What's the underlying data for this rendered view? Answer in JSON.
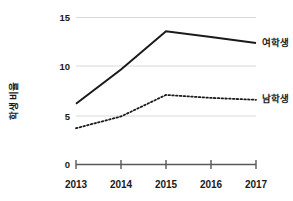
{
  "chart_data": {
    "type": "line",
    "title": "",
    "xlabel": "",
    "ylabel": "학생 비율",
    "categories": [
      "2013",
      "2014",
      "2015",
      "2016",
      "2017"
    ],
    "x": [
      2013,
      2014,
      2015,
      2016,
      2017
    ],
    "series": [
      {
        "name": "여학생",
        "style": "solid",
        "color": "#1a1a1a",
        "values": [
          6.2,
          9.7,
          13.6,
          13.0,
          12.4
        ]
      },
      {
        "name": "남학생",
        "style": "dotted",
        "color": "#1a1a1a",
        "values": [
          3.7,
          4.9,
          7.1,
          6.8,
          6.6
        ]
      }
    ],
    "ylim": [
      0,
      15
    ],
    "yticks": [
      0,
      5,
      10,
      15
    ],
    "ytick_labels": [
      "0",
      "5",
      "10",
      "15"
    ],
    "grid": true,
    "grid_axis": "y",
    "grid_color": "#d9d9d9",
    "legend": "inline-right",
    "legend_entries": [
      "여학생",
      "남학생"
    ],
    "axis_color": "#595959"
  },
  "axis": {
    "y_ticks": [
      {
        "label": "15",
        "value": 15
      },
      {
        "label": "10",
        "value": 10
      },
      {
        "label": "5",
        "value": 5
      },
      {
        "label": "0",
        "value": 0
      }
    ],
    "x_ticks": [
      {
        "label": "2013"
      },
      {
        "label": "2014"
      },
      {
        "label": "2015"
      },
      {
        "label": "2016"
      },
      {
        "label": "2017"
      }
    ],
    "y_title": "학생 비율"
  },
  "series_labels": {
    "female": "여학생",
    "male": "남학생"
  }
}
